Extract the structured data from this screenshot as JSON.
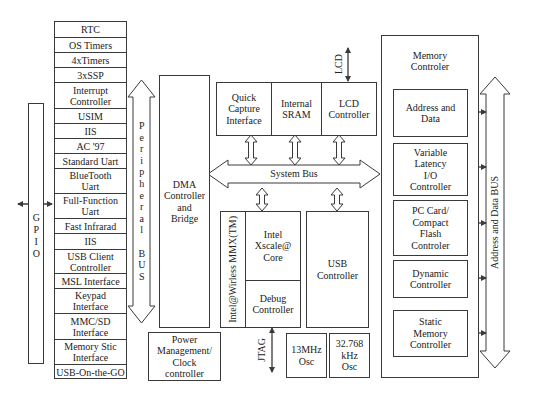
{
  "diagram": {
    "peripherals": [
      "RTC",
      "OS Timers",
      "4xTimers",
      "3xSSP",
      "Interrupt\nController",
      "USIM",
      "IIS",
      "AC '97",
      "Standard Uart",
      "BlueTooth\nUart",
      "Full-Function\nUart",
      "Fast Infrarad",
      "IIS",
      "USB Client\nController",
      "MSL Interface",
      "Keypad\nInterface",
      "MMC/SD\nInterface",
      "Memory Stic\nInterface",
      "USB-On-the-GO"
    ],
    "gpio_label": "GPIO",
    "peripheral_bus_label": "Peripheral BUS",
    "dma": "DMA\nController\nand\nBridge",
    "power": "Power\nManagement/\nClock\ncontroller",
    "top_blocks": [
      "Quick\nCapture\nInterface",
      "Internal\nSRAM",
      "LCD\nController"
    ],
    "lcd_label": "LCD",
    "system_bus": "System Bus",
    "core": {
      "side_label": "Intel@Wirless MMX(TM)",
      "core": "Intel\nXscale@\nCore",
      "debug": "Debug\nController"
    },
    "usb_controller": "USB\nController",
    "jtag_label": "JTAG",
    "osc": [
      "13MHz\nOsc",
      "32.768\nkHz\nOsc"
    ],
    "memory_controller": {
      "title": "Memory\nControler",
      "blocks": [
        "Address and\nData",
        "Variable\nLatency\nI/O\nController",
        "PC Card/\nCompact\nFlash\nControler",
        "Dynamic\nController",
        "Static\nMemory\nController"
      ]
    },
    "address_data_bus": "Address and Data BUS",
    "colors": {
      "line": "#3a3a3a",
      "text": "#222222",
      "background": "#ffffff"
    }
  }
}
